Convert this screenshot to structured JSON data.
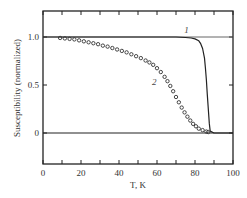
{
  "chart_data": {
    "type": "line",
    "title": "",
    "xlabel": "T, K",
    "ylabel": "Susceptibility (normalized)",
    "xlim": [
      0,
      100
    ],
    "ylim": [
      -0.32,
      1.27
    ],
    "x_ticks": [
      0,
      20,
      40,
      60,
      80,
      100
    ],
    "x_tick_labels": [
      "0",
      "20",
      "40",
      "60",
      "80",
      "100"
    ],
    "x_minor_step": 10,
    "y_ticks": [
      0,
      0.5,
      1.0
    ],
    "y_tick_labels": [
      "0",
      "0.5",
      "1.0"
    ],
    "grid": false,
    "reference_lines": [
      1.0,
      0
    ],
    "series": [
      {
        "name": "1",
        "style": "solid-line",
        "label_pos": {
          "x": 75.5,
          "y": 1.04
        },
        "x": [
          0,
          70,
          75,
          78,
          80,
          82,
          83,
          84,
          85,
          85.5,
          86,
          86.5,
          87,
          87.5,
          88,
          90,
          100
        ],
        "values": [
          1.0,
          1.0,
          0.995,
          0.99,
          0.98,
          0.96,
          0.93,
          0.88,
          0.78,
          0.68,
          0.55,
          0.4,
          0.25,
          0.1,
          0.02,
          0.0,
          0.0
        ]
      },
      {
        "name": "2",
        "style": "open-circles",
        "label_pos": {
          "x": 58.5,
          "y": 0.5
        },
        "x": [
          9,
          11.5,
          14,
          16.5,
          19,
          21.5,
          24,
          26.5,
          29,
          31.5,
          34,
          36.5,
          39,
          41.5,
          44,
          46.5,
          49,
          51.5,
          54,
          56,
          58,
          60,
          62,
          64,
          65.5,
          67,
          68.5,
          70,
          71.5,
          73,
          74.5,
          76,
          77.5,
          79,
          80.5,
          82,
          84,
          86,
          87
        ],
        "values": [
          0.99,
          0.985,
          0.98,
          0.975,
          0.965,
          0.955,
          0.945,
          0.935,
          0.925,
          0.91,
          0.9,
          0.885,
          0.87,
          0.855,
          0.84,
          0.82,
          0.8,
          0.78,
          0.755,
          0.735,
          0.71,
          0.675,
          0.635,
          0.585,
          0.54,
          0.49,
          0.435,
          0.375,
          0.32,
          0.265,
          0.215,
          0.17,
          0.13,
          0.095,
          0.07,
          0.045,
          0.03,
          0.015,
          0.01
        ]
      }
    ]
  }
}
